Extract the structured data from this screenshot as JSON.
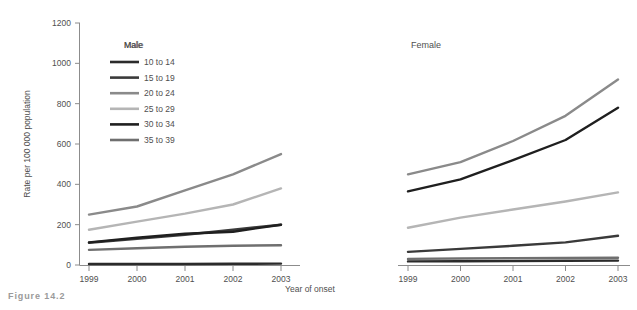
{
  "figure": {
    "caption": "Figure 14.2"
  },
  "chart_data": {
    "type": "line",
    "title": "",
    "xlabel": "Year of onset",
    "ylabel": "Rate per 100 000 population",
    "x": [
      1999,
      2000,
      2001,
      2002,
      2003
    ],
    "xtick_labels": [
      "1999",
      "2000",
      "2001",
      "2002",
      "2003"
    ],
    "ylim": [
      0,
      1200
    ],
    "ytick_values": [
      0,
      200,
      400,
      600,
      800,
      1000,
      1200
    ],
    "ytick_labels": [
      "0",
      "200",
      "400",
      "600",
      "800",
      "1000",
      "1200"
    ],
    "grid": false,
    "legend_position": "upper-left-inside",
    "legend_title": "Male",
    "panels": [
      {
        "name": "Male",
        "label": "Male",
        "series": [
          {
            "name": "10 to 14",
            "color": "#2b2b2b",
            "values": [
              5,
              5,
              5,
              6,
              7
            ]
          },
          {
            "name": "15 to 19",
            "color": "#3a3a3a",
            "values": [
              110,
              130,
              150,
              175,
              200
            ]
          },
          {
            "name": "20 to 24",
            "color": "#8a8a8a",
            "values": [
              250,
              290,
              370,
              450,
              550
            ]
          },
          {
            "name": "25 to 29",
            "color": "#b5b5b5",
            "values": [
              175,
              215,
              255,
              300,
              380
            ]
          },
          {
            "name": "30 to 34",
            "color": "#1f1f1f",
            "values": [
              112,
              135,
              155,
              165,
              200
            ]
          },
          {
            "name": "35 to 39",
            "color": "#6f6f6f",
            "values": [
              75,
              83,
              90,
              95,
              98
            ]
          }
        ]
      },
      {
        "name": "Female",
        "label": "Female",
        "series": [
          {
            "name": "10 to 14",
            "color": "#2b2b2b",
            "values": [
              18,
              19,
              20,
              21,
              22
            ]
          },
          {
            "name": "15 to 19",
            "color": "#3a3a3a",
            "values": [
              65,
              80,
              95,
              112,
              145
            ]
          },
          {
            "name": "20 to 24",
            "color": "#8a8a8a",
            "values": [
              450,
              510,
              615,
              740,
              920
            ]
          },
          {
            "name": "25 to 29",
            "color": "#b5b5b5",
            "values": [
              185,
              235,
              275,
              315,
              360
            ]
          },
          {
            "name": "30 to 34",
            "color": "#1f1f1f",
            "values": [
              365,
              425,
              520,
              620,
              780
            ]
          },
          {
            "name": "35 to 39",
            "color": "#6f6f6f",
            "values": [
              30,
              32,
              34,
              35,
              36
            ]
          }
        ]
      }
    ],
    "legend_entries": [
      {
        "label": "10 to 14",
        "color": "#2b2b2b"
      },
      {
        "label": "15 to 19",
        "color": "#3a3a3a"
      },
      {
        "label": "20 to 24",
        "color": "#8a8a8a"
      },
      {
        "label": "25 to 29",
        "color": "#b5b5b5"
      },
      {
        "label": "30 to 34",
        "color": "#1f1f1f"
      },
      {
        "label": "35 to 39",
        "color": "#6f6f6f"
      }
    ]
  }
}
